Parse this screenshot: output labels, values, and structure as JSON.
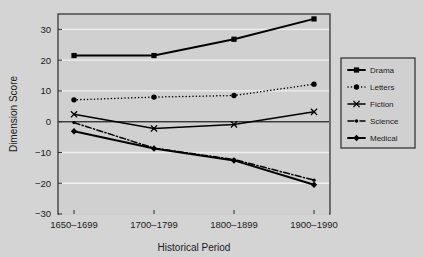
{
  "chart_data": {
    "type": "line",
    "title": "",
    "subtitle": "",
    "xlabel": "Historical Period",
    "ylabel": "Dimension Score",
    "categories": [
      "1650–1699",
      "1700–1799",
      "1800–1899",
      "1900–1990"
    ],
    "ylim": [
      -30,
      35
    ],
    "yticks": [
      -30,
      -20,
      -10,
      0,
      10,
      20,
      30
    ],
    "ytick_labels": [
      "−30",
      "−20",
      "−10",
      "0",
      "10",
      "20",
      "30"
    ],
    "grid": true,
    "grid_axis": "y",
    "legend_position": "right-outside",
    "zero_line": true,
    "series": [
      {
        "name": "Drama",
        "values": [
          21.5,
          21.5,
          26.8,
          33.4
        ],
        "marker": "square",
        "linestyle": "solid",
        "color": "#000000"
      },
      {
        "name": "Letters",
        "values": [
          7.1,
          8.0,
          8.5,
          12.2
        ],
        "marker": "circle",
        "linestyle": "dotted",
        "color": "#000000"
      },
      {
        "name": "Fiction",
        "values": [
          2.4,
          -2.2,
          -0.9,
          3.2
        ],
        "marker": "x",
        "linestyle": "solid",
        "color": "#000000"
      },
      {
        "name": "Science",
        "values": [
          -0.3,
          -8.6,
          -12.3,
          -19.0
        ],
        "marker": "dot",
        "linestyle": "dashdot",
        "color": "#000000"
      },
      {
        "name": "Medical",
        "values": [
          -3.1,
          -8.7,
          -12.6,
          -20.5
        ],
        "marker": "diamond",
        "linestyle": "solid",
        "color": "#000000"
      }
    ]
  },
  "legend": {
    "entries": [
      {
        "label": "Drama"
      },
      {
        "label": "Letters"
      },
      {
        "label": "Fiction"
      },
      {
        "label": "Science"
      },
      {
        "label": "Medical"
      }
    ]
  },
  "colors": {
    "background": "#d4d4d4",
    "plot_background": "#d0d0d0",
    "foreground": "#1a1a1a",
    "gridline": "#f0f0f0",
    "border": "#2a2a2a"
  }
}
